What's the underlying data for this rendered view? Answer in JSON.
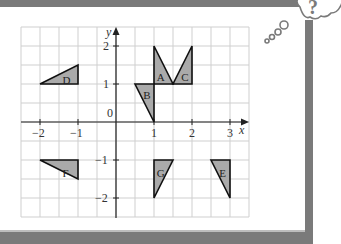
{
  "diagram": {
    "type": "coordinate-grid-transformations",
    "axes": {
      "x_label": "x",
      "y_label": "y",
      "x_ticks": [
        "−2",
        "−1",
        "0",
        "1",
        "2",
        "3"
      ],
      "y_ticks": [
        "2",
        "1",
        "−1",
        "−2"
      ],
      "x_range": [
        -2.5,
        3.5
      ],
      "y_range": [
        -2.5,
        2.5
      ],
      "grid_step": 0.5
    },
    "shapes": [
      {
        "label": "A",
        "vertices": [
          [
            1,
            2
          ],
          [
            1,
            1
          ],
          [
            1.5,
            1
          ]
        ],
        "label_pos": [
          1.18,
          1.18
        ]
      },
      {
        "label": "B",
        "vertices": [
          [
            0.5,
            1
          ],
          [
            1,
            1
          ],
          [
            1,
            0
          ]
        ],
        "label_pos": [
          0.82,
          0.7
        ]
      },
      {
        "label": "C",
        "vertices": [
          [
            1.5,
            1
          ],
          [
            2,
            1
          ],
          [
            2,
            2
          ]
        ],
        "label_pos": [
          1.82,
          1.18
        ]
      },
      {
        "label": "D",
        "vertices": [
          [
            -2,
            1
          ],
          [
            -1,
            1
          ],
          [
            -1,
            1.5
          ]
        ],
        "label_pos": [
          -1.3,
          1.1
        ]
      },
      {
        "label": "E",
        "vertices": [
          [
            2.5,
            -1
          ],
          [
            3,
            -1
          ],
          [
            3,
            -2
          ]
        ],
        "label_pos": [
          2.82,
          -1.35
        ]
      },
      {
        "label": "F",
        "vertices": [
          [
            -2,
            -1
          ],
          [
            -1,
            -1
          ],
          [
            -1,
            -1.5
          ]
        ],
        "label_pos": [
          -1.3,
          -1.35
        ]
      },
      {
        "label": "G",
        "vertices": [
          [
            1,
            -1
          ],
          [
            1.5,
            -1
          ],
          [
            1,
            -2
          ]
        ],
        "label_pos": [
          1.18,
          -1.35
        ]
      }
    ]
  },
  "decoration": {
    "thought_bubble_symbol": "?",
    "frame_color": "#7a7a7a",
    "shape_fill": "#aaaaaa"
  }
}
